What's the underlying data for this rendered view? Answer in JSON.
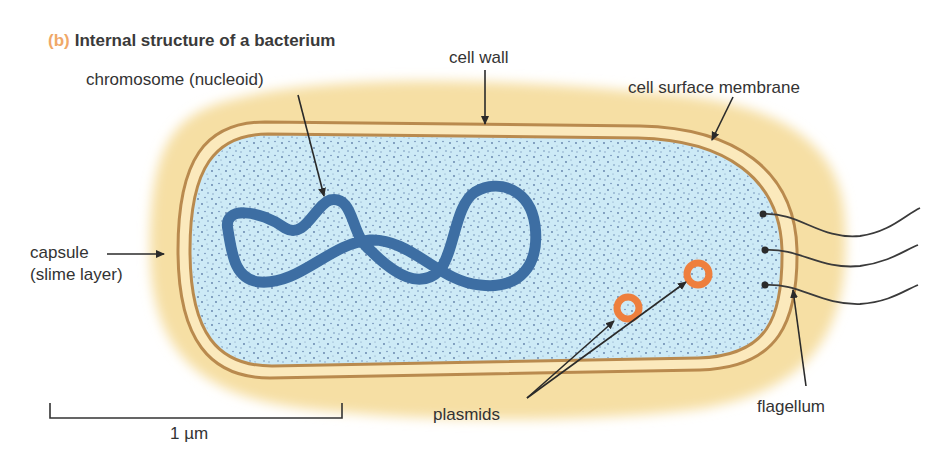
{
  "figure": {
    "tag": "(b)",
    "title": "Internal structure of a bacterium"
  },
  "labels": {
    "chromosome": "chromosome (nucleoid)",
    "cell_wall": "cell wall",
    "cell_surface_membrane": "cell surface membrane",
    "capsule_line1": "capsule",
    "capsule_line2": "(slime layer)",
    "plasmids": "plasmids",
    "flagellum": "flagellum",
    "scale_bar": "1 µm"
  },
  "colors": {
    "capsule": "#f6dfa4",
    "cell_wall_lines": "#b98a4e",
    "cytoplasm": "#cdeaf6",
    "cytoplasm_dots": "#4a6a9a",
    "chromosome": "#3d6ea3",
    "plasmid": "#ee7f3d",
    "tag": "#f0a868",
    "text": "#333333"
  },
  "components": [
    "capsule",
    "cell wall",
    "cell surface membrane",
    "cytoplasm",
    "chromosome",
    "plasmids",
    "flagella"
  ],
  "flagella_count": 3,
  "plasmid_count": 2
}
